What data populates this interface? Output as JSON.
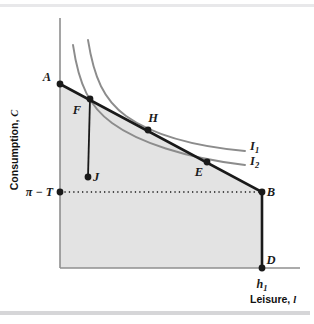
{
  "figure": {
    "type": "economics-budget-constraint-indifference-diagram",
    "axes": {
      "y_label": "Consumption, C",
      "y_label_var": "C",
      "y_label_text": "Consumption,",
      "x_label_text": "Leisure,",
      "x_label_var": "l",
      "x_label": "Leisure, l",
      "y_axis_top_px": 18,
      "origin_px": [
        60,
        268
      ],
      "x_axis_right_px": 300
    },
    "ticks": {
      "y": [
        {
          "label_base": "π − T",
          "label": "π − T",
          "y_px": 192
        }
      ],
      "x": [
        {
          "label_base": "h",
          "label_sub": "1",
          "label": "h₁",
          "x_px": 262
        }
      ]
    },
    "points": [
      {
        "name": "A",
        "label": "A",
        "x_px": 60,
        "y_px": 84,
        "label_dx": -13,
        "label_dy": -3
      },
      {
        "name": "F",
        "label": "F",
        "x_px": 90,
        "y_px": 99,
        "label_dx": -13,
        "label_dy": 15
      },
      {
        "name": "H",
        "label": "H",
        "x_px": 148,
        "y_px": 130,
        "label_dx": 5,
        "label_dy": -8
      },
      {
        "name": "E",
        "label": "E",
        "x_px": 207,
        "y_px": 162,
        "label_dx": -8,
        "label_dy": 14
      },
      {
        "name": "B",
        "label": "B",
        "x_px": 262,
        "y_px": 192,
        "label_dx": 9,
        "label_dy": 4
      },
      {
        "name": "D",
        "label": "D",
        "x_px": 262,
        "y_px": 268,
        "label_dx": 9,
        "label_dy": -4
      },
      {
        "name": "J",
        "label": "J",
        "x_px": 88,
        "y_px": 177,
        "label_dx": 8,
        "label_dy": 4
      },
      {
        "name": "piT",
        "label": "",
        "x_px": 60,
        "y_px": 192,
        "label_dx": 0,
        "label_dy": 0
      }
    ],
    "curves": [
      {
        "name": "I1",
        "label_base": "I",
        "label_sub": "1",
        "label": "I₁",
        "label_x_px": 250,
        "label_y_px": 150,
        "color": "#8c8c8c",
        "path": "M 88,40 C 94,78 104,100 126,116 C 150,133 190,146 245,151"
      },
      {
        "name": "I2",
        "label_base": "I",
        "label_sub": "2",
        "label": "I₂",
        "label_x_px": 250,
        "label_y_px": 165,
        "color": "#8c8c8c",
        "path": "M 73,45 C 79,86 90,107 112,123 C 138,142 185,158 245,165"
      }
    ],
    "budget_lines": [
      {
        "name": "budget-line-ABD",
        "color": "#1a1a1a",
        "points_px": "60,84 262,192 262,268"
      }
    ],
    "vertical_drop": {
      "name": "F-to-J-segment",
      "color": "#1a1a1a",
      "from_px": [
        90,
        99
      ],
      "to_px": [
        88,
        177
      ]
    },
    "dotted_line": {
      "name": "pi-minus-T-dotted-line",
      "color": "#1a1a1a",
      "from_px": [
        60,
        192
      ],
      "to_px": [
        262,
        192
      ]
    },
    "shaded_region": {
      "name": "feasible-set",
      "fill": "#e3e3e3",
      "points_px": "60,84 262,192 262,268 60,268"
    },
    "colors": {
      "curve_gray": "#8c8c8c",
      "shade_gray": "#e3e3e3",
      "line_black": "#1a1a1a",
      "axis_gray": "#8f8f8f",
      "band_gray": "#e8e8ea"
    }
  }
}
